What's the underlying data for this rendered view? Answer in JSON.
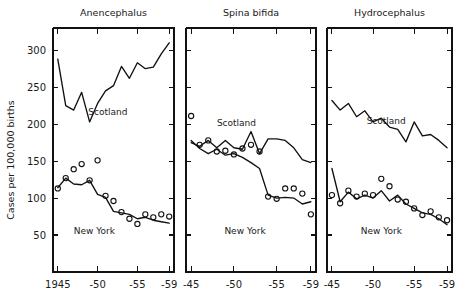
{
  "figure": {
    "ylabel": "Cases per 100,000 births",
    "background": "#ffffff",
    "ink": "#111111"
  },
  "chart_data": {
    "type": "line",
    "title": "",
    "xlabel": "",
    "ylabel": "Cases per 100,000 births",
    "ylim": [
      0,
      330
    ],
    "yticks": [
      50,
      100,
      150,
      200,
      250,
      300
    ],
    "ytick_labels": [
      "50",
      "100",
      "150",
      "200",
      "250",
      "300"
    ],
    "grid": false,
    "legend_position": "inline-annotation",
    "panels": [
      {
        "title": "Anencephalus",
        "xlim": [
          1944.4,
          1959.6
        ],
        "xticks": [
          1945,
          1950,
          1955,
          1959
        ],
        "xtick_labels": [
          "1945",
          "-50",
          "-55",
          "-59"
        ],
        "annotations": [
          {
            "text": "Scotland",
            "x": 1951.3,
            "y": 212
          },
          {
            "text": "New York",
            "x": 1949.6,
            "y": 52
          }
        ],
        "series": [
          {
            "name": "Scotland",
            "style": "line",
            "x": [
              1945,
              1946,
              1947,
              1948,
              1949,
              1950,
              1951,
              1952,
              1953,
              1954,
              1955,
              1956,
              1957,
              1958,
              1959
            ],
            "values": [
              288,
              225,
              219,
              243,
              203,
              228,
              245,
              252,
              278,
              262,
              283,
              275,
              277,
              295,
              310
            ]
          },
          {
            "name": "New York",
            "style": "line",
            "x": [
              1945,
              1946,
              1947,
              1948,
              1949,
              1950,
              1951,
              1952,
              1953,
              1954,
              1955,
              1956,
              1957,
              1958,
              1959
            ],
            "values": [
              114,
              127,
              119,
              118,
              124,
              105,
              101,
              82,
              80,
              78,
              72,
              74,
              70,
              68,
              66
            ]
          },
          {
            "name": "Scotland (points)",
            "style": "markers",
            "x": [
              1945,
              1946,
              1947,
              1948,
              1949,
              1950,
              1951,
              1952,
              1953,
              1954,
              1955,
              1956,
              1957,
              1958,
              1959
            ],
            "values": [
              113,
              127,
              139,
              146,
              124,
              151,
              103,
              96,
              81,
              72,
              65,
              78,
              74,
              78,
              75
            ]
          }
        ]
      },
      {
        "title": "Spina bifida",
        "xlim": [
          1944.4,
          1959.6
        ],
        "xticks": [
          1945,
          1950,
          1955,
          1959
        ],
        "xtick_labels": [
          "-45",
          "-50",
          "-55",
          "-59"
        ],
        "annotations": [
          {
            "text": "Scotland",
            "x": 1950.3,
            "y": 197
          },
          {
            "text": "New York",
            "x": 1951.3,
            "y": 52
          }
        ],
        "series": [
          {
            "name": "Scotland",
            "style": "line",
            "x": [
              1945,
              1946,
              1947,
              1948,
              1949,
              1950,
              1951,
              1952,
              1953,
              1954,
              1955,
              1956,
              1957,
              1958,
              1959
            ],
            "values": [
              175,
              170,
              178,
              168,
              178,
              168,
              166,
              190,
              160,
              180,
              180,
              178,
              168,
              152,
              148
            ]
          },
          {
            "name": "New York",
            "style": "line",
            "x": [
              1945,
              1946,
              1947,
              1948,
              1949,
              1950,
              1951,
              1952,
              1953,
              1954,
              1955,
              1956,
              1957,
              1958,
              1959
            ],
            "values": [
              178,
              167,
              160,
              166,
              158,
              160,
              155,
              148,
              140,
              104,
              100,
              101,
              100,
              92,
              95
            ]
          },
          {
            "name": "Scotland (points)",
            "style": "markers",
            "x": [
              1945,
              1946,
              1947,
              1948,
              1949,
              1950,
              1951,
              1952,
              1953,
              1954,
              1955,
              1956,
              1957,
              1958,
              1959
            ],
            "values": [
              211,
              172,
              178,
              163,
              164,
              159,
              167,
              172,
              163,
              102,
              99,
              113,
              113,
              106,
              78
            ]
          }
        ]
      },
      {
        "title": "Hydrocephalus",
        "xlim": [
          1944.4,
          1959.6
        ],
        "xticks": [
          1945,
          1950,
          1955,
          1959
        ],
        "xtick_labels": [
          "-45",
          "-50",
          "-55",
          "-59"
        ],
        "annotations": [
          {
            "text": "Scotland",
            "x": 1951.6,
            "y": 200
          },
          {
            "text": "New York",
            "x": 1951.0,
            "y": 52
          }
        ],
        "series": [
          {
            "name": "Scotland",
            "style": "line",
            "x": [
              1945,
              1946,
              1947,
              1948,
              1949,
              1950,
              1951,
              1952,
              1953,
              1954,
              1955,
              1956,
              1957,
              1958,
              1959
            ],
            "values": [
              232,
              219,
              228,
              210,
              218,
              203,
              208,
              196,
              193,
              176,
              203,
              184,
              186,
              178,
              168
            ]
          },
          {
            "name": "New York",
            "style": "line",
            "x": [
              1945,
              1946,
              1947,
              1948,
              1949,
              1950,
              1951,
              1952,
              1953,
              1954,
              1955,
              1956,
              1957,
              1958,
              1959
            ],
            "values": [
              140,
              95,
              108,
              99,
              104,
              100,
              110,
              96,
              104,
              92,
              86,
              80,
              78,
              72,
              64
            ]
          },
          {
            "name": "Scotland (points)",
            "style": "markers",
            "x": [
              1945,
              1946,
              1947,
              1948,
              1949,
              1950,
              1951,
              1952,
              1953,
              1954,
              1955,
              1956,
              1957,
              1958,
              1959
            ],
            "values": [
              104,
              93,
              110,
              102,
              106,
              104,
              126,
              116,
              98,
              95,
              86,
              77,
              82,
              74,
              70
            ]
          }
        ]
      }
    ]
  }
}
